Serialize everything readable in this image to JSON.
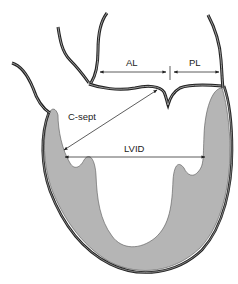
{
  "diagram": {
    "labels": {
      "al": "AL",
      "pl": "PL",
      "c_sept": "C-sept",
      "lvid": "LVID"
    },
    "colors": {
      "background": "#ffffff",
      "myocardium_fill": "#b3b3b3",
      "outline": "#2a2a2a",
      "vessel_inner": "#9a9a9a",
      "arrow": "#333333"
    }
  }
}
